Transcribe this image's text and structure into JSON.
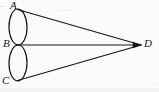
{
  "figure": {
    "kind": "geometry-diagram",
    "background_color": "#fbfbfa",
    "ink_color": "#16161a",
    "stroke_width": 1.2,
    "canvas": {
      "width": 159,
      "height": 92
    },
    "labels": {
      "a": "A",
      "b": "B",
      "c": "C",
      "d": "D"
    },
    "points": {
      "A": {
        "x": 17.5,
        "y": 9.5
      },
      "B": {
        "x": 16.5,
        "y": 45.0
      },
      "C": {
        "x": 17.5,
        "y": 80.5
      },
      "D": {
        "x": 141.0,
        "y": 45.0
      }
    },
    "ellipses": [
      {
        "name": "upper-ellipse",
        "cx": 18.0,
        "cy": 27.0,
        "rx": 9.0,
        "ry": 18.0
      },
      {
        "name": "lower-ellipse",
        "cx": 18.0,
        "cy": 63.0,
        "rx": 9.0,
        "ry": 18.0
      }
    ],
    "segments": [
      {
        "name": "segment-AD",
        "from": "A",
        "to": "D"
      },
      {
        "name": "segment-BD",
        "from": "B",
        "to": "D"
      },
      {
        "name": "segment-CD",
        "from": "C",
        "to": "D"
      }
    ]
  }
}
